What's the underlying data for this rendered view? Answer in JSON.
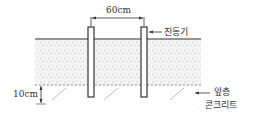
{
  "diagram": {
    "spacing_label": "60cm",
    "depth_label": "10cm",
    "vibrator_label": "진동기",
    "previous_layer_label_line1": "앞층",
    "previous_layer_label_line2": "콘크리트",
    "colors": {
      "line": "#333333",
      "concrete_fill": "#f4f4f4",
      "hatch": "#b0b0b0"
    }
  }
}
